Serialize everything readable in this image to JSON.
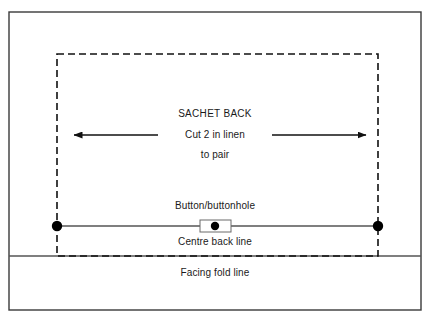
{
  "diagram": {
    "colors": {
      "outer_frame": "#3a3a3a",
      "cut_line": "#111111",
      "fold_line": "#555555",
      "centre_back_line": "#555555",
      "grain_arrow": "#111111",
      "marker_dot": "#000000",
      "text": "#1a1a1a",
      "background": "#ffffff"
    },
    "outer_frame": {
      "name": "outer-frame",
      "x": 9,
      "y": 12,
      "width": 412,
      "height": 298,
      "stroke_width": 1.4
    },
    "cutting_line": {
      "name": "dashed-cutting-line",
      "x": 57,
      "y": 54,
      "width": 321,
      "height": 202,
      "dash": "7 4",
      "stroke_width": 1.6,
      "style": "dashed"
    },
    "facing_fold_line": {
      "name": "facing-fold-line",
      "y": 256,
      "x1": 9,
      "x2": 421,
      "stroke_width": 1.3
    },
    "centre_back_line": {
      "name": "centre-back-line",
      "y": 226,
      "x1": 57,
      "x2": 378,
      "stroke_width": 1.3
    },
    "grain_arrows": [
      {
        "name": "grain-arrow-left",
        "direction": "left",
        "x_start": 158,
        "x_end": 72,
        "y": 135
      },
      {
        "name": "grain-arrow-right",
        "direction": "right",
        "x_start": 272,
        "x_end": 368,
        "y": 135
      }
    ],
    "corner_dots": [
      {
        "name": "notch-dot-left",
        "cx": 57,
        "cy": 226,
        "r": 5.2
      },
      {
        "name": "notch-dot-right",
        "cx": 378,
        "cy": 226,
        "r": 5.2
      }
    ],
    "button_marker": {
      "name": "button-buttonhole-marker",
      "rect_x": 200,
      "rect_y": 220,
      "rect_width": 31,
      "rect_height": 12,
      "dot_cx": 215,
      "dot_cy": 226,
      "dot_r": 4.2
    },
    "labels": {
      "piece_name": {
        "text": "SACHET BACK",
        "x": 215,
        "y": 114,
        "size": 10
      },
      "cut_instruction": {
        "text": "Cut 2 in linen",
        "x": 215,
        "y": 135,
        "size": 10
      },
      "pair_instruction": {
        "text": "to pair",
        "x": 215,
        "y": 155,
        "size": 10
      },
      "button_buttonhole": {
        "text": "Button/buttonhole",
        "x": 215,
        "y": 206,
        "size": 10
      },
      "centre_back": {
        "text": "Centre back line",
        "x": 215,
        "y": 242,
        "size": 10
      },
      "facing_fold": {
        "text": "Facing fold line",
        "x": 215,
        "y": 273,
        "size": 10
      }
    }
  }
}
